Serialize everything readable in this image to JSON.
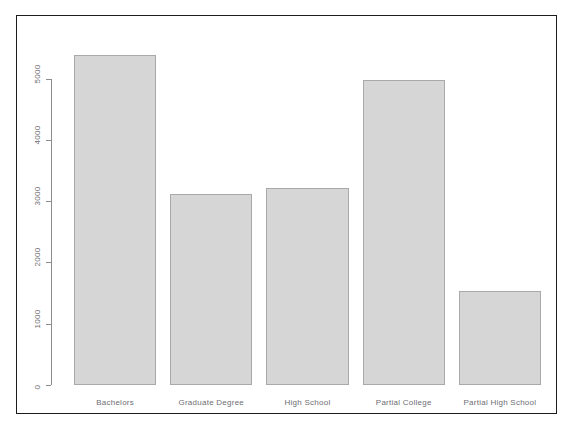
{
  "chart_data": {
    "type": "bar",
    "title": "",
    "subtitle": "",
    "xlabel": "",
    "ylabel": "",
    "categories": [
      "Bachelors",
      "Graduate Degree",
      "High School",
      "Partial College",
      "Partial High School"
    ],
    "values": [
      5385,
      3120,
      3210,
      4985,
      1540
    ],
    "ylim": [
      0,
      5500
    ],
    "y_ticks": [
      0,
      1000,
      2000,
      3000,
      4000,
      5000
    ],
    "y_tick_labels": [
      "0",
      "1000",
      "2000",
      "3000",
      "4000",
      "5000"
    ],
    "grid": false,
    "legend": null,
    "bar_fill_color": "#d6d6d6",
    "bar_border_color": "#a9a9a9",
    "axis_color": "#8c8c8c",
    "frame_color": "#1c1c1c",
    "background_color": "#ffffff",
    "y_axis_rotation_deg": 90
  },
  "top_clipped_text": "",
  "figure": {
    "name": "barplot-figure"
  }
}
